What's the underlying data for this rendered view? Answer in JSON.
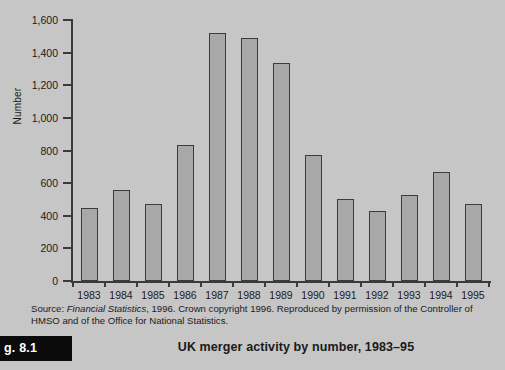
{
  "chart_data": {
    "type": "bar",
    "title": "UK merger activity by number, 1983–95",
    "xlabel": "",
    "ylabel": "Number",
    "categories": [
      "1983",
      "1984",
      "1985",
      "1986",
      "1987",
      "1988",
      "1989",
      "1990",
      "1991",
      "1992",
      "1993",
      "1994",
      "1995"
    ],
    "values": [
      445,
      560,
      470,
      835,
      1520,
      1490,
      1335,
      775,
      500,
      430,
      525,
      670,
      475
    ],
    "ylim": [
      0,
      1600
    ],
    "ytick_values": [
      0,
      200,
      400,
      600,
      800,
      1000,
      1200,
      1400,
      1600
    ],
    "ytick_labels": [
      "0",
      "200",
      "400",
      "600",
      "800",
      "1,000",
      "1,200",
      "1,400",
      "1,600"
    ],
    "grid": false,
    "legend": null,
    "bar_color": "#a8a8a8",
    "bar_edge_color": "#3c3c3c",
    "background_color": "#c6c6c6",
    "axis_color": "#3a3a3a"
  },
  "source_note": {
    "prefix": "Source: ",
    "italic_part": "Financial Statistics",
    "suffix": ", 1996. Crown copyright 1996. Reproduced by permission of the Controller of HMSO and of the Office for National Statistics."
  },
  "caption": {
    "figure_tag": "g. 8.1",
    "title": "UK merger activity by number, 1983–95"
  }
}
